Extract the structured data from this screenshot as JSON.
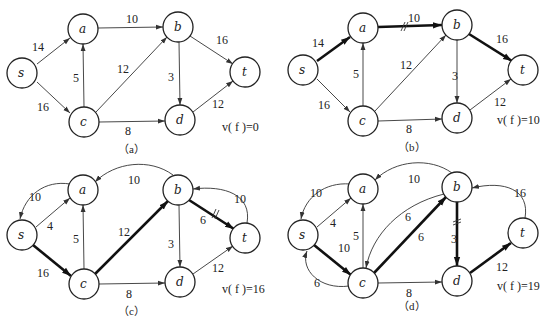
{
  "panels": [
    {
      "id": "a",
      "caption": "（a）",
      "flow_value": "v( f )=0",
      "nodes": {
        "s": "s",
        "a": "a",
        "b": "b",
        "c": "c",
        "d": "d",
        "t": "t"
      },
      "edges": [
        {
          "from": "s",
          "to": "a",
          "label": "14",
          "bold": false
        },
        {
          "from": "s",
          "to": "c",
          "label": "16",
          "bold": false
        },
        {
          "from": "c",
          "to": "a",
          "label": "5",
          "bold": false
        },
        {
          "from": "a",
          "to": "b",
          "label": "10",
          "bold": false
        },
        {
          "from": "c",
          "to": "b",
          "label": "12",
          "bold": false
        },
        {
          "from": "c",
          "to": "d",
          "label": "8",
          "bold": false
        },
        {
          "from": "b",
          "to": "d",
          "label": "3",
          "bold": false
        },
        {
          "from": "b",
          "to": "t",
          "label": "16",
          "bold": false
        },
        {
          "from": "d",
          "to": "t",
          "label": "12",
          "bold": false
        }
      ]
    },
    {
      "id": "b",
      "caption": "（b）",
      "flow_value": "v( f )=10",
      "nodes": {
        "s": "s",
        "a": "a",
        "b": "b",
        "c": "c",
        "d": "d",
        "t": "t"
      },
      "edges": [
        {
          "from": "s",
          "to": "a",
          "label": "14",
          "bold": true
        },
        {
          "from": "s",
          "to": "c",
          "label": "16",
          "bold": false
        },
        {
          "from": "c",
          "to": "a",
          "label": "5",
          "bold": false
        },
        {
          "from": "a",
          "to": "b",
          "label": "10",
          "bold": true,
          "saturated": true
        },
        {
          "from": "c",
          "to": "b",
          "label": "12",
          "bold": false
        },
        {
          "from": "c",
          "to": "d",
          "label": "8",
          "bold": false
        },
        {
          "from": "b",
          "to": "d",
          "label": "3",
          "bold": false
        },
        {
          "from": "b",
          "to": "t",
          "label": "16",
          "bold": true
        },
        {
          "from": "d",
          "to": "t",
          "label": "12",
          "bold": false
        }
      ]
    },
    {
      "id": "c",
      "caption": "（c）",
      "flow_value": "v( f )=16",
      "nodes": {
        "s": "s",
        "a": "a",
        "b": "b",
        "c": "c",
        "d": "d",
        "t": "t"
      },
      "edges": [
        {
          "from": "a",
          "to": "s",
          "label": "10",
          "bold": false,
          "curved": true
        },
        {
          "from": "s",
          "to": "a",
          "label": "4",
          "bold": false
        },
        {
          "from": "s",
          "to": "c",
          "label": "16",
          "bold": true
        },
        {
          "from": "c",
          "to": "a",
          "label": "5",
          "bold": false
        },
        {
          "from": "b",
          "to": "a",
          "label": "10",
          "bold": false,
          "curved": true
        },
        {
          "from": "c",
          "to": "b",
          "label": "12",
          "bold": true
        },
        {
          "from": "c",
          "to": "d",
          "label": "8",
          "bold": false
        },
        {
          "from": "b",
          "to": "d",
          "label": "3",
          "bold": false
        },
        {
          "from": "b",
          "to": "t",
          "label": "6",
          "bold": true,
          "saturated": true
        },
        {
          "from": "t",
          "to": "b",
          "label": "10",
          "bold": false,
          "curved": true
        },
        {
          "from": "d",
          "to": "t",
          "label": "12",
          "bold": false
        }
      ]
    },
    {
      "id": "d",
      "caption": "（d）",
      "flow_value": "v( f )=19",
      "nodes": {
        "s": "s",
        "a": "a",
        "b": "b",
        "c": "c",
        "d": "d",
        "t": "t"
      },
      "edges": [
        {
          "from": "a",
          "to": "s",
          "label": "10",
          "bold": false,
          "curved": true
        },
        {
          "from": "s",
          "to": "a",
          "label": "4",
          "bold": false
        },
        {
          "from": "s",
          "to": "c",
          "label": "10",
          "bold": true
        },
        {
          "from": "c",
          "to": "s",
          "label": "6",
          "bold": false,
          "curved": true
        },
        {
          "from": "c",
          "to": "a",
          "label": "5",
          "bold": false
        },
        {
          "from": "b",
          "to": "a",
          "label": "10",
          "bold": false,
          "curved": true
        },
        {
          "from": "b",
          "to": "c",
          "label": "6",
          "bold": false,
          "curved": true
        },
        {
          "from": "c",
          "to": "b",
          "label": "6",
          "bold": true
        },
        {
          "from": "c",
          "to": "d",
          "label": "8",
          "bold": false
        },
        {
          "from": "b",
          "to": "d",
          "label": "3",
          "bold": true,
          "saturated": true
        },
        {
          "from": "t",
          "to": "b",
          "label": "16",
          "bold": false,
          "curved": true
        },
        {
          "from": "d",
          "to": "t",
          "label": "12",
          "bold": true
        }
      ]
    }
  ]
}
